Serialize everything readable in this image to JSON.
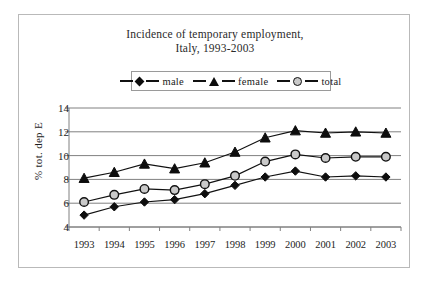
{
  "chart_data": {
    "type": "line",
    "title": "Incidence of temporary employment, Italy, 1993-2003",
    "title_line1": "Incidence of temporary employment,",
    "title_line2": "Italy, 1993-2003",
    "xlabel": "",
    "ylabel": "% tot. dep E",
    "categories": [
      "1993",
      "1994",
      "1995",
      "1996",
      "1997",
      "1998",
      "1999",
      "2000",
      "2001",
      "2002",
      "2003"
    ],
    "ylim": [
      4,
      14
    ],
    "yticks": [
      4,
      6,
      8,
      10,
      12,
      14
    ],
    "grid": true,
    "legend_position": "top-center",
    "series": [
      {
        "name": "male",
        "marker": "diamond",
        "color": "#0d0d0d",
        "values": [
          5.0,
          5.7,
          6.1,
          6.3,
          6.8,
          7.5,
          8.2,
          8.7,
          8.2,
          8.3,
          8.2
        ]
      },
      {
        "name": "female",
        "marker": "triangle",
        "color": "#0d0d0d",
        "values": [
          8.1,
          8.6,
          9.3,
          8.9,
          9.4,
          10.3,
          11.5,
          12.1,
          11.9,
          12.0,
          11.9
        ]
      },
      {
        "name": "total",
        "marker": "circle",
        "color": "#c9c9c9",
        "values": [
          6.1,
          6.7,
          7.2,
          7.1,
          7.6,
          8.3,
          9.5,
          10.1,
          9.8,
          9.9,
          9.9
        ]
      }
    ]
  },
  "legend": {
    "items": [
      {
        "label": "male",
        "marker": "diamond-marker"
      },
      {
        "label": "female",
        "marker": "triangle-marker"
      },
      {
        "label": "total",
        "marker": "circle-marker"
      }
    ]
  },
  "axis": {
    "y_label": "% tot. dep E",
    "y_ticks": [
      "14",
      "12",
      "10",
      "8",
      "6",
      "4"
    ],
    "x_ticks": [
      "1993",
      "1994",
      "1995",
      "1996",
      "1997",
      "1998",
      "1999",
      "2000",
      "2001",
      "2002",
      "2003"
    ]
  }
}
